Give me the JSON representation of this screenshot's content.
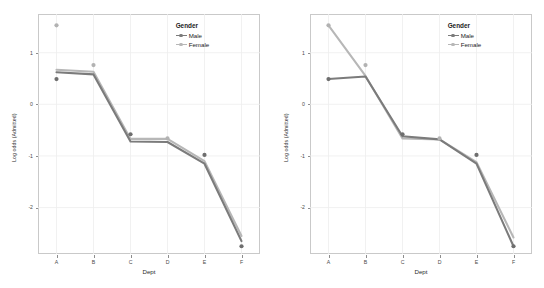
{
  "figure": {
    "panel_count": 2,
    "background": "#ffffff",
    "panel_border": "#c9c9c9",
    "grid_color": "#ededed"
  },
  "legend": {
    "title": "Gender",
    "entries": [
      {
        "label": "Male",
        "color": "#7b7b7b"
      },
      {
        "label": "Female",
        "color": "#b7b7b7"
      }
    ]
  },
  "chart_data": [
    {
      "type": "line",
      "id": "left-panel",
      "title": "",
      "xlabel": "Dept",
      "ylabel": "Log odds (Admitted)",
      "categories": [
        "A",
        "B",
        "C",
        "D",
        "E",
        "F"
      ],
      "ylim": [
        -2.9,
        1.75
      ],
      "yticks": [
        1,
        0,
        -1,
        -2
      ],
      "ytick_labels": [
        "1",
        "0",
        "-1",
        "-2"
      ],
      "grid": true,
      "legend_position": "top-right-inside",
      "series": [
        {
          "name": "Male",
          "color": "#7b7b7b",
          "kind": "fitted-line",
          "values": [
            0.62,
            0.58,
            -0.72,
            -0.73,
            -1.15,
            -2.65
          ]
        },
        {
          "name": "Female",
          "color": "#b7b7b7",
          "kind": "fitted-line",
          "values": [
            0.67,
            0.63,
            -0.67,
            -0.67,
            -1.1,
            -2.55
          ]
        }
      ],
      "observed_points": [
        {
          "series": "Male",
          "x": "A",
          "y": 0.49,
          "color": "#6e6e6e"
        },
        {
          "series": "Male",
          "x": "C",
          "y": -0.58,
          "color": "#6e6e6e"
        },
        {
          "series": "Male",
          "x": "E",
          "y": -0.98,
          "color": "#6e6e6e"
        },
        {
          "series": "Male",
          "x": "F",
          "y": -2.75,
          "color": "#6e6e6e"
        },
        {
          "series": "Female",
          "x": "A",
          "y": 1.53,
          "color": "#b2b2b2"
        },
        {
          "series": "Female",
          "x": "B",
          "y": 0.76,
          "color": "#b2b2b2"
        },
        {
          "series": "Female",
          "x": "D",
          "y": -0.66,
          "color": "#b2b2b2"
        }
      ]
    },
    {
      "type": "line",
      "id": "right-panel",
      "title": "",
      "xlabel": "Dept",
      "ylabel": "Log odds (Admitted)",
      "categories": [
        "A",
        "B",
        "C",
        "D",
        "E",
        "F"
      ],
      "ylim": [
        -2.9,
        1.75
      ],
      "yticks": [
        1,
        0,
        -1,
        -2
      ],
      "ytick_labels": [
        "1",
        "0",
        "-1",
        "-2"
      ],
      "grid": true,
      "legend_position": "top-right-inside",
      "series": [
        {
          "name": "Male",
          "color": "#7b7b7b",
          "kind": "fitted-line",
          "values": [
            0.49,
            0.54,
            -0.62,
            -0.68,
            -1.15,
            -2.75
          ]
        },
        {
          "name": "Female",
          "color": "#b7b7b7",
          "kind": "fitted-line",
          "values": [
            1.53,
            0.55,
            -0.66,
            -0.68,
            -1.12,
            -2.58
          ]
        }
      ],
      "observed_points": [
        {
          "series": "Male",
          "x": "A",
          "y": 0.49,
          "color": "#6e6e6e"
        },
        {
          "series": "Male",
          "x": "C",
          "y": -0.58,
          "color": "#6e6e6e"
        },
        {
          "series": "Male",
          "x": "E",
          "y": -0.98,
          "color": "#6e6e6e"
        },
        {
          "series": "Male",
          "x": "F",
          "y": -2.75,
          "color": "#6e6e6e"
        },
        {
          "series": "Female",
          "x": "A",
          "y": 1.53,
          "color": "#b2b2b2"
        },
        {
          "series": "Female",
          "x": "B",
          "y": 0.76,
          "color": "#b2b2b2"
        },
        {
          "series": "Female",
          "x": "D",
          "y": -0.66,
          "color": "#b2b2b2"
        }
      ]
    }
  ]
}
